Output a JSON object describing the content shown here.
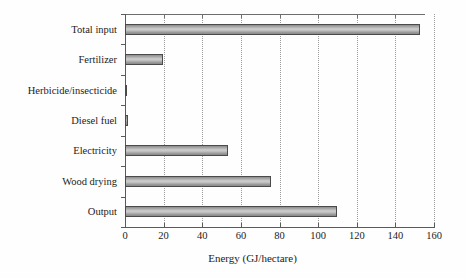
{
  "chart_data": {
    "type": "bar",
    "orientation": "horizontal",
    "title": "",
    "subtitle": "",
    "xlabel": "Energy (GJ/hectare)",
    "ylabel": "",
    "categories": [
      "Total input",
      "Fertilizer",
      "Herbicide/insecticide",
      "Diesel fuel",
      "Electricity",
      "Wood drying",
      "Output"
    ],
    "values": [
      152.8,
      19.5,
      0.5,
      1.5,
      53.3,
      75.6,
      109.8
    ],
    "xlim": [
      0,
      160
    ],
    "xticks": [
      0,
      20,
      40,
      60,
      80,
      100,
      120,
      140,
      160
    ],
    "xtick_labels": [
      "0",
      "20",
      "40",
      "60",
      "80",
      "100",
      "120",
      "140",
      "160"
    ],
    "grid": true,
    "grid_axis": "x",
    "grid_style": "dotted",
    "legend": false,
    "legend_position": "none",
    "bar_fill": "#b5b5b5",
    "bar_edge": "#4a4a4a",
    "background": "#fefefe",
    "text_color": "#1c1c1c"
  }
}
